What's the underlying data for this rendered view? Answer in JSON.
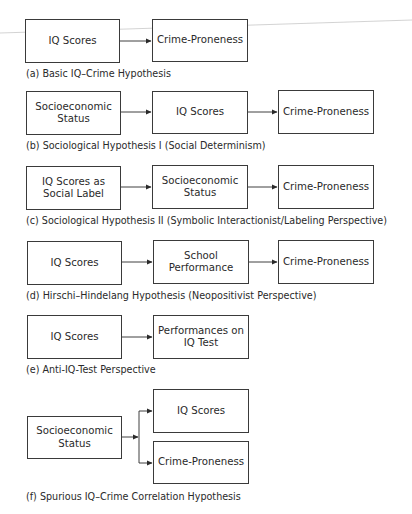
{
  "diagrams": [
    {
      "id": "a",
      "caption": "(a) Basic IQ–Crime Hypothesis",
      "boxes": [
        "IQ Scores",
        "Crime-Proneness"
      ]
    },
    {
      "id": "b",
      "caption": "(b) Sociological Hypothesis I (Social Determinism)",
      "boxes": [
        "Socioeconomic\nStatus",
        "IQ Scores",
        "Crime-Proneness"
      ]
    },
    {
      "id": "c",
      "caption": "(c) Sociological Hypothesis II (Symbolic Interactionist/Labeling Perspective)",
      "boxes": [
        "IQ Scores as\nSocial Label",
        "Socioeconomic\nStatus",
        "Crime-Proneness"
      ]
    },
    {
      "id": "d",
      "caption": "(d) Hirschi–Hindelang Hypothesis (Neopositivist Perspective)",
      "boxes": [
        "IQ Scores",
        "School\nPerformance",
        "Crime-Proneness"
      ]
    },
    {
      "id": "e",
      "caption": "(e) Anti-IQ-Test Perspective",
      "boxes": [
        "IQ Scores",
        "Performances on\nIQ Test"
      ]
    },
    {
      "id": "f",
      "caption": "(f) Spurious IQ–Crime Correlation Hypothesis",
      "boxes": [
        "Socioeconomic\nStatus",
        "IQ Scores",
        "Crime-Proneness"
      ]
    }
  ],
  "colors": {
    "stroke": "#3a3a3a",
    "text": "#2a2a2a",
    "stray_line": "#c8c8c8"
  }
}
